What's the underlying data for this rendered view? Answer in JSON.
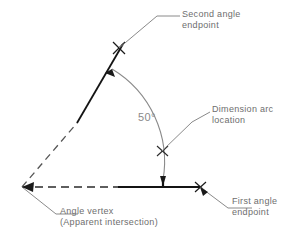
{
  "diagram": {
    "angle_value_label": "50°",
    "colors": {
      "geometry_line": "#1a1a1a",
      "construction_line": "#555555",
      "leader_line": "#8a8a8a",
      "text": "#6e6e6e",
      "background": "#ffffff"
    },
    "annotations": [
      {
        "id": "second-angle-endpoint",
        "line1": "Second angle",
        "line2": "endpoint"
      },
      {
        "id": "dimension-arc-location",
        "line1": "Dimension arc",
        "line2": "location"
      },
      {
        "id": "first-angle-endpoint",
        "line1": "First angle",
        "line2": "endpoint"
      },
      {
        "id": "angle-vertex",
        "line1": "Angle vertex",
        "line2": "(Apparent intersection)"
      }
    ],
    "markers": [
      {
        "id": "second-angle-endpoint-marker",
        "type": "x-mark",
        "x": 119,
        "y": 48
      },
      {
        "id": "dimension-arc-marker",
        "type": "x-mark",
        "x": 162,
        "y": 151
      },
      {
        "id": "first-angle-endpoint-marker",
        "type": "x-mark",
        "x": 200,
        "y": 187
      },
      {
        "id": "angle-vertex-marker",
        "type": "arrow-target",
        "x": 22,
        "y": 187
      },
      {
        "id": "horizontal-tick-marker",
        "type": "tick",
        "x": 163,
        "y": 187
      }
    ],
    "geometry": {
      "vertex": {
        "x": 22,
        "y": 187
      },
      "first_ray_end": {
        "x": 200,
        "y": 187
      },
      "second_ray_end": {
        "x": 119,
        "y": 48
      },
      "arc_radius_px": 108,
      "arc_start_angle_deg": 0,
      "arc_end_angle_deg": 50
    }
  }
}
